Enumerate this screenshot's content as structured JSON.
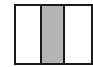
{
  "diagram": {
    "panels": [
      {
        "id": "left",
        "fill": "#ffffff"
      },
      {
        "id": "middle",
        "fill": "#b4b4b4"
      },
      {
        "id": "right",
        "fill": "#ffffff"
      }
    ],
    "border_color": "#1a1a1a"
  }
}
